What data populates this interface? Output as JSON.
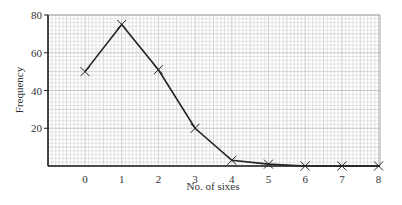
{
  "chart_data": {
    "type": "line",
    "title": "",
    "xlabel": "No. of sixes",
    "ylabel": "Frequency",
    "x": [
      0,
      1,
      2,
      3,
      4,
      5,
      6,
      7,
      8
    ],
    "categories": [
      "0",
      "1",
      "2",
      "3",
      "4",
      "5",
      "6",
      "7",
      "8"
    ],
    "series": [
      {
        "name": "Frequency",
        "values": [
          50,
          75,
          51,
          20,
          3,
          1,
          0,
          0,
          0
        ]
      }
    ],
    "xlim": [
      -1.1,
      8
    ],
    "ylim": [
      0,
      80
    ],
    "yticks": [
      20,
      40,
      60,
      80
    ],
    "xticks": [
      0,
      1,
      2,
      3,
      4,
      5,
      6,
      7,
      8
    ],
    "grid": true,
    "marker": "cross",
    "legend": null
  },
  "colors": {
    "line": "#222222",
    "grid_minor": "#d4d4d4",
    "grid_major": "#a8a8a8",
    "axis": "#222222"
  }
}
